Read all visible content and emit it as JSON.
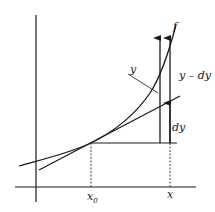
{
  "diagram": {
    "colors": {
      "stroke": "#1a1a1a",
      "background": "#ffffff"
    },
    "labels": {
      "curve": "f",
      "y_pointer": "y",
      "y_minus_dy": "y – dy",
      "dy": "dy",
      "x0_main": "x",
      "x0_sub": "0",
      "x": "x"
    }
  }
}
